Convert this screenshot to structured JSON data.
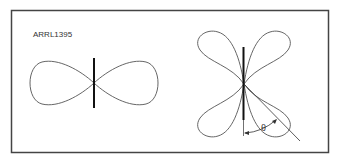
{
  "figure": {
    "id_label": "ARRL1395",
    "angle_label": "θ",
    "colors": {
      "frame": "#444444",
      "curve": "#555555",
      "antenna": "#111111",
      "background": "#ffffff"
    },
    "panels": [
      {
        "name": "half-wave-dipole-pattern",
        "description": "figure-eight radiation pattern with vertical antenna element"
      },
      {
        "name": "long-wire-pattern",
        "description": "four-lobe radiation pattern with angle theta measured from antenna axis"
      }
    ]
  }
}
